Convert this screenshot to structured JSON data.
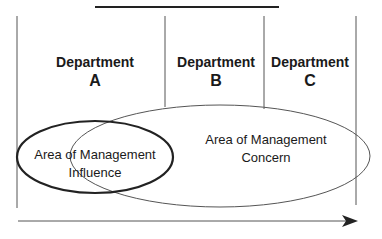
{
  "departments": [
    {
      "title": "Department",
      "letter": "A"
    },
    {
      "title": "Department",
      "letter": "B"
    },
    {
      "title": "Department",
      "letter": "C"
    }
  ],
  "areas": {
    "influence": {
      "line1": "Area of Management",
      "line2": "Influence"
    },
    "concern": {
      "line1": "Area of Management",
      "line2": "Concern"
    }
  },
  "colors": {
    "line": "#222222",
    "thin_line": "#555555",
    "background": "#ffffff"
  }
}
